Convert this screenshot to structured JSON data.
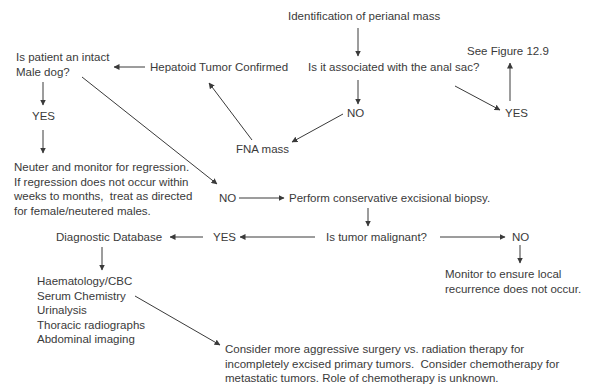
{
  "flowchart": {
    "start": "Identification of perianal mass",
    "anal_sac_question": "Is it associated with the anal sac?",
    "anal_sac_yes": "YES",
    "see_figure": "See Figure 12.9",
    "anal_sac_no": "NO",
    "fna_mass": "FNA mass",
    "hepatoid_confirmed": "Hepatoid Tumor Confirmed",
    "intact_male_question": "Is patient an intact\nMale dog?",
    "intact_male_yes": "YES",
    "neuter_instructions": "Neuter and monitor for regression.\nIf regression does not occur within\nweeks to months,  treat as directed\nfor female/neutered males.",
    "intact_male_no": "NO",
    "excisional_biopsy": "Perform conservative excisional biopsy.",
    "malignant_question": "Is tumor malignant?",
    "malignant_yes": "YES",
    "malignant_no": "NO",
    "diagnostic_database": "Diagnostic Database",
    "diagnostic_tests": "Haematology/CBC\nSerum Chemistry\nUrinalysis\nThoracic radiographs\nAbdominal imaging",
    "monitor_recurrence": "Monitor to ensure local\nrecurrence does not occur.",
    "aggressive_treatment": "Consider more aggressive surgery vs. radiation therapy for\nincompletely excised primary tumors.  Consider chemotherapy for\nmetastatic tumors. Role of chemotherapy is unknown."
  },
  "colors": {
    "text": "#3a3a3a",
    "background": "#ffffff"
  }
}
